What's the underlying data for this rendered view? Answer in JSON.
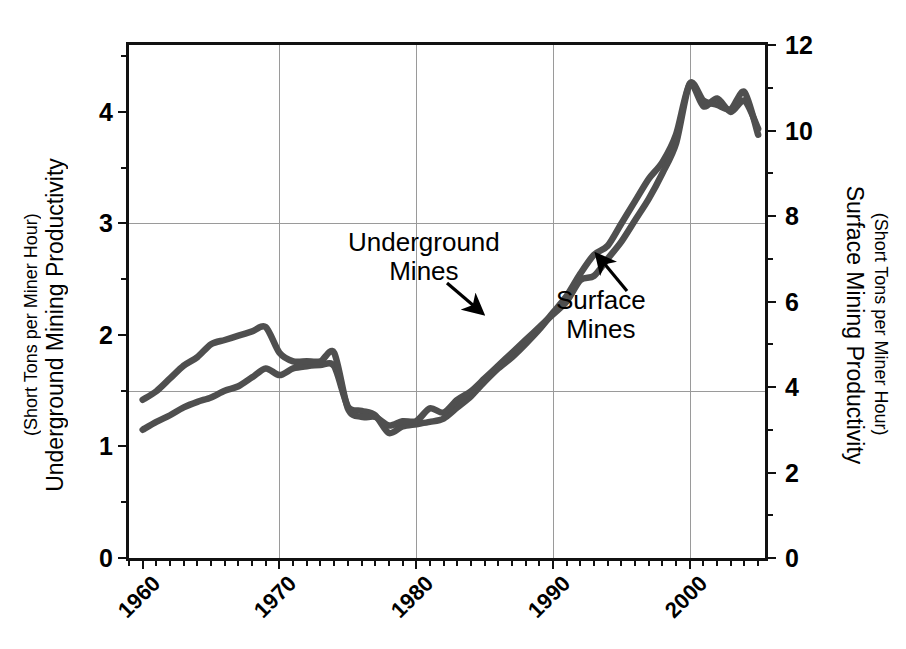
{
  "chart_data": {
    "type": "line",
    "title": "",
    "subtitle": "",
    "xlabel": "",
    "grid": true,
    "legend_position": "inline-annotations",
    "x": [
      1960,
      1961,
      1962,
      1963,
      1964,
      1965,
      1966,
      1967,
      1968,
      1969,
      1970,
      1971,
      1972,
      1973,
      1974,
      1975,
      1976,
      1977,
      1978,
      1979,
      1980,
      1981,
      1982,
      1983,
      1984,
      1985,
      1986,
      1987,
      1988,
      1989,
      1990,
      1991,
      1992,
      1993,
      1994,
      1995,
      1996,
      1997,
      1998,
      1999,
      2000,
      2001,
      2002,
      2003,
      2004,
      2005
    ],
    "xlim": [
      1959,
      2005.5
    ],
    "xticks": [
      1960,
      1970,
      1980,
      1990,
      2000
    ],
    "xtick_labels": [
      "1960",
      "1970",
      "1980",
      "1990",
      "2000"
    ],
    "x_minor_tick_interval": 1,
    "left_axis": {
      "label_main": "Underground Mining Productivity",
      "label_sub": "(Short Tons per Miner Hour)",
      "ylim": [
        0,
        4.6
      ],
      "ticks": [
        0,
        1,
        2,
        3,
        4
      ],
      "tick_labels": [
        "0",
        "1",
        "2",
        "3",
        "4"
      ],
      "minor_ticks": [
        0.5,
        1.5,
        2.5,
        3.5,
        4.5
      ],
      "units": "Short Tons per Miner Hour"
    },
    "right_axis": {
      "label_main": "Surface Mining Productivity",
      "label_sub": "(Short Tons per Miner Hour)",
      "ylim": [
        0,
        12
      ],
      "ticks": [
        0,
        2,
        4,
        6,
        8,
        10,
        12
      ],
      "tick_labels": [
        "0",
        "2",
        "4",
        "6",
        "8",
        "10",
        "12"
      ],
      "minor_ticks": [
        1,
        3,
        5,
        7,
        9,
        11
      ],
      "units": "Short Tons per Miner Hour"
    },
    "gridlines": {
      "vertical_at": [
        1970,
        1980,
        1990,
        2000
      ],
      "horizontal_left_at": [
        1.5,
        3.0
      ]
    },
    "series": [
      {
        "name": "Underground Mines",
        "axis": "left",
        "units": "Short Tons per Miner Hour",
        "color": "#4f4f4f",
        "values": [
          1.15,
          1.22,
          1.28,
          1.35,
          1.4,
          1.44,
          1.5,
          1.54,
          1.62,
          1.7,
          1.64,
          1.7,
          1.72,
          1.73,
          1.72,
          1.36,
          1.32,
          1.28,
          1.12,
          1.18,
          1.2,
          1.22,
          1.25,
          1.35,
          1.45,
          1.58,
          1.7,
          1.8,
          1.92,
          2.05,
          2.2,
          2.35,
          2.55,
          2.72,
          2.8,
          3.0,
          3.2,
          3.4,
          3.55,
          3.8,
          4.25,
          4.05,
          4.12,
          4.0,
          4.1,
          3.85
        ]
      },
      {
        "name": "Surface Mines",
        "axis": "right",
        "units": "Short Tons per Miner Hour",
        "color": "#4f4f4f",
        "values": [
          3.7,
          3.9,
          4.2,
          4.5,
          4.7,
          5.0,
          5.1,
          5.2,
          5.3,
          5.4,
          4.8,
          4.6,
          4.6,
          4.6,
          4.8,
          3.5,
          3.3,
          3.3,
          3.1,
          3.2,
          3.2,
          3.5,
          3.4,
          3.7,
          3.9,
          4.2,
          4.5,
          4.8,
          5.1,
          5.4,
          5.7,
          6.0,
          6.5,
          6.6,
          7.0,
          7.4,
          7.9,
          8.4,
          9.0,
          9.7,
          11.1,
          10.7,
          10.6,
          10.5,
          10.9,
          9.9
        ]
      }
    ],
    "annotations": [
      {
        "id": "underground",
        "line1": "Underground",
        "line2": "Mines",
        "target_series": "Underground Mines"
      },
      {
        "id": "surface",
        "line1": "Surface",
        "line2": "Mines",
        "target_series": "Surface Mines"
      }
    ]
  }
}
